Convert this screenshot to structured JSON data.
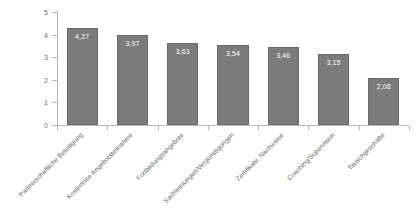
{
  "chart_data": {
    "type": "bar",
    "title": "",
    "subtitle": "",
    "xlabel": "",
    "ylabel": "",
    "ylim": [
      0,
      5
    ],
    "yticks": [
      "0",
      "1",
      "2",
      "3",
      "4",
      "5"
    ],
    "grid": false,
    "legend": false,
    "orientation": "vertical",
    "label_rotation": -45,
    "value_label_position": "inside-top",
    "decimal_separator": ",",
    "categories": [
      "Partnerschaftliche Beteiligung",
      "Kostenlose Angebotsteilnahme",
      "Fortbildungsangebote",
      "Sachleistungen/Vergünstigungen",
      "Zertifikate, Nachweise",
      "Coaching/Supervision",
      "Tauschgeschäfte"
    ],
    "values": [
      4.27,
      3.97,
      3.63,
      3.54,
      3.46,
      3.15,
      2.08
    ],
    "value_labels": [
      "4,27",
      "3,97",
      "3,63",
      "3,54",
      "3,46",
      "3,15",
      "2,08"
    ],
    "colors": {
      "bar_fill": "#7b7b7b",
      "bar_border": "#6a6a6a",
      "value_text": "#ffffff",
      "axis_line": "#b8b8b8",
      "tick_text": "#6e6e6e",
      "category_text": "#5f5f5f",
      "background": "#ffffff"
    }
  }
}
